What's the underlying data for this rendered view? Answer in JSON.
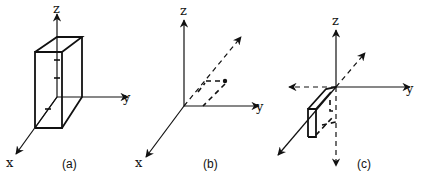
{
  "figures": [
    {
      "id": "a",
      "caption": "(a)",
      "axes": {
        "z": "z",
        "y": "y",
        "x": "x"
      },
      "description": "Rectangular box aligned with axes, with tick marks on z and x axes"
    },
    {
      "id": "b",
      "caption": "(b)",
      "axes": {
        "z": "z",
        "y": "y",
        "x": "x"
      },
      "description": "Dashed diagonal vector from origin with point marked and dashed projection lines"
    },
    {
      "id": "c",
      "caption": "(c)",
      "axes": {
        "z": "z",
        "y": "y",
        "x": "x"
      },
      "description": "Axes with dashed negative directions, dashed diagonal, and small box in negative-z region"
    }
  ],
  "colors": {
    "ink": "#111111",
    "background": "#ffffff"
  }
}
